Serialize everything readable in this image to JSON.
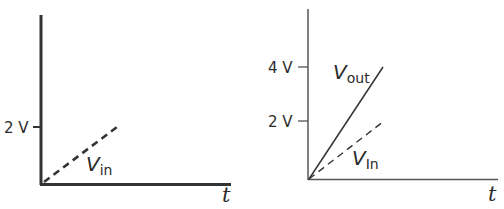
{
  "colors": {
    "ink": "#2a2a2a",
    "background": "#ffffff"
  },
  "left_graph": {
    "y_tick_label": "2 V",
    "x_axis_label": "t",
    "curve_label_main": "V",
    "curve_label_sub": "in",
    "curve_style": "dashed"
  },
  "right_graph": {
    "y_tick_labels": [
      "4 V",
      "2 V"
    ],
    "x_axis_label": "t",
    "vout_label_main": "V",
    "vout_label_sub": "out",
    "vout_style": "solid",
    "vin_label_main": "V",
    "vin_label_sub": "In",
    "vin_style": "dashed"
  }
}
